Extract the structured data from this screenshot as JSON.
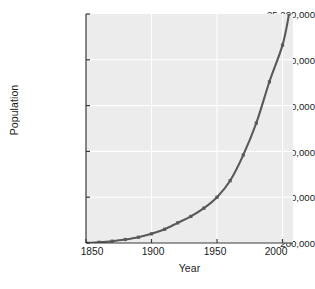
{
  "chart_data": {
    "type": "line",
    "title": "",
    "xlabel": "Year",
    "ylabel": "Population",
    "xlim": [
      1850,
      2008
    ],
    "ylim": [
      200000,
      25200000
    ],
    "xticks": [
      1850,
      1900,
      1950,
      2000
    ],
    "xtick_labels": [
      "1850",
      "1900",
      "1950",
      "2000"
    ],
    "yticks": [
      200000,
      5200000,
      10200000,
      15200000,
      20200000,
      25200000
    ],
    "ytick_labels": [
      "200,000",
      "5,200,000",
      "10,200,000",
      "15,200,000",
      "20,200,000",
      "25,200,000"
    ],
    "grid": true,
    "legend": false,
    "marker": "square",
    "line_color": "#595959",
    "plot_background": "#ececec",
    "grid_color": "#ffffff",
    "series": [
      {
        "name": "Population",
        "x": [
          1850,
          1860,
          1870,
          1880,
          1890,
          1900,
          1910,
          1920,
          1930,
          1940,
          1950,
          1960,
          1970,
          1980,
          1990,
          2000,
          2005
        ],
        "values": [
          200000,
          280000,
          400000,
          580000,
          830000,
          1200000,
          1700000,
          2400000,
          3100000,
          4000000,
          5200000,
          7000000,
          9800000,
          13300000,
          17800000,
          21800000,
          25200000
        ]
      }
    ]
  },
  "axes": {
    "spine_color": "#3a3a3a"
  }
}
